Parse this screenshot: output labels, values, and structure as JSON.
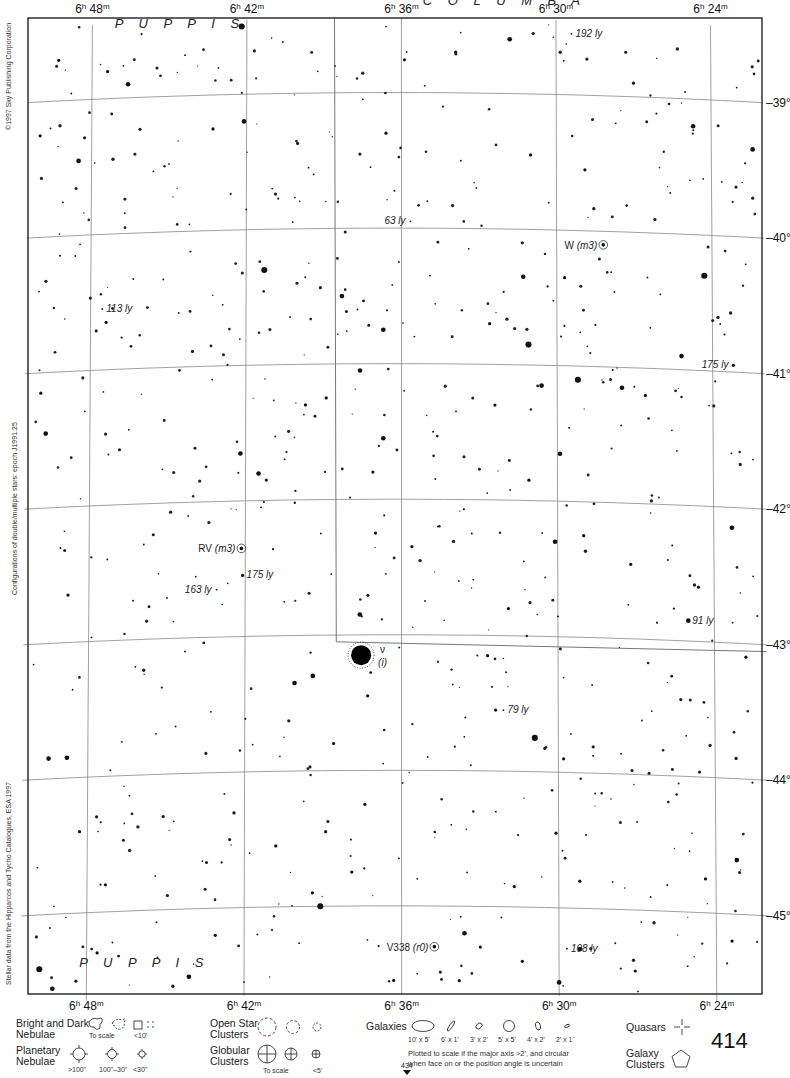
{
  "atlas": {
    "page_number": "414",
    "adjacent_page_below": "434",
    "copyright": "©1997 Sky Publishing Corporation",
    "epoch_note": "Configurations of double/multiple stars: epoch J1991.25",
    "data_source": "Stellar data from the Hipparcos and Tycho Catalogues, ESA 1997"
  },
  "chart_data": {
    "type": "scatter",
    "x_axis": {
      "label": "Right Ascension",
      "ticks": [
        "6h 48m",
        "6h 42m",
        "6h 36m",
        "6h 30m",
        "6h 24m"
      ],
      "tick_parts": [
        {
          "h": "6",
          "m": "48"
        },
        {
          "h": "6",
          "m": "42"
        },
        {
          "h": "6",
          "m": "36"
        },
        {
          "h": "6",
          "m": "30"
        },
        {
          "h": "6",
          "m": "24"
        }
      ],
      "range_minutes": [
        50.5,
        22.0
      ]
    },
    "y_axis": {
      "label": "Declination",
      "ticks": [
        "-39°",
        "-40°",
        "-41°",
        "-42°",
        "-43°",
        "-44°",
        "-45°"
      ],
      "range_deg": [
        -38.45,
        -45.65
      ]
    },
    "grid": true,
    "constellations": [
      {
        "name": "PUPPIS",
        "ra_min": 44.6,
        "dec": -38.5
      },
      {
        "name": "COLUMBA",
        "ra_min": 32.0,
        "dec": -38.35
      },
      {
        "name": "PUPPIS",
        "ra_min": 45.8,
        "dec": -45.42
      }
    ],
    "boundary": [
      [
        38.6,
        -38.45
      ],
      [
        38.5,
        -43.05
      ],
      [
        22.0,
        -43.05
      ]
    ],
    "labeled_objects": [
      {
        "label": "ν",
        "sublabel": "(i)",
        "ra_min": 37.55,
        "dec": -43.15,
        "mag": 1,
        "type": "star-variable"
      },
      {
        "label": "RV (m3)",
        "ra_min": 42.15,
        "dec": -42.35,
        "mag": 6,
        "type": "variable"
      },
      {
        "label": "W (m3)",
        "ra_min": 28.2,
        "dec": -40.1,
        "mag": 9,
        "type": "variable"
      },
      {
        "label": "V338 (r0)",
        "ra_min": 34.75,
        "dec": -45.3,
        "mag": 8,
        "type": "variable"
      },
      {
        "label": "192 ly",
        "ra_min": 29.4,
        "dec": -38.55,
        "mag": 6,
        "type": "distance"
      },
      {
        "label": "63 ly",
        "ra_min": 35.65,
        "dec": -39.95,
        "mag": 7,
        "type": "distance"
      },
      {
        "label": "113 ly",
        "ra_min": 47.55,
        "dec": -40.55,
        "mag": 7,
        "type": "distance"
      },
      {
        "label": "175 ly",
        "ra_min": 23.2,
        "dec": -40.95,
        "mag": 5,
        "type": "distance"
      },
      {
        "label": "175 ly",
        "ra_min": 42.1,
        "dec": -42.55,
        "mag": 5,
        "type": "distance"
      },
      {
        "label": "163 ly",
        "ra_min": 43.1,
        "dec": -42.65,
        "mag": 6,
        "type": "distance"
      },
      {
        "label": "91 ly",
        "ra_min": 25.0,
        "dec": -42.85,
        "mag": 4,
        "type": "distance"
      },
      {
        "label": "79 ly",
        "ra_min": 32.1,
        "dec": -43.55,
        "mag": 6,
        "type": "distance"
      },
      {
        "label": "108 ly",
        "ra_min": 29.7,
        "dec": -45.3,
        "mag": 7,
        "type": "distance"
      }
    ],
    "stars": [
      [
        42.2,
        -38.5,
        3
      ],
      [
        49.3,
        -38.7,
        5
      ],
      [
        35.2,
        -38.4,
        7
      ],
      [
        31.8,
        -38.6,
        4
      ],
      [
        33.9,
        -38.7,
        5
      ],
      [
        35.8,
        -38.7,
        6
      ],
      [
        29.7,
        -38.75,
        7
      ],
      [
        35.1,
        -38.95,
        6
      ],
      [
        27.0,
        -38.9,
        5
      ],
      [
        25.0,
        -38.95,
        6
      ],
      [
        23.0,
        -38.9,
        7
      ],
      [
        50.0,
        -39.25,
        5
      ],
      [
        43.1,
        -38.8,
        7
      ],
      [
        44.4,
        -38.7,
        6
      ],
      [
        47.4,
        -38.8,
        5
      ],
      [
        48.8,
        -38.95,
        6
      ],
      [
        49.6,
        -39.2,
        6
      ],
      [
        46.6,
        -38.9,
        4
      ],
      [
        42.1,
        -39.2,
        4
      ],
      [
        43.3,
        -39.25,
        5
      ],
      [
        36.6,
        -39.3,
        5
      ],
      [
        37.5,
        -39.05,
        6
      ],
      [
        33.7,
        -39.5,
        6
      ],
      [
        31.0,
        -39.45,
        5
      ],
      [
        27.7,
        -39.2,
        6
      ],
      [
        24.7,
        -39.2,
        4
      ],
      [
        22.4,
        -39.35,
        4
      ],
      [
        48.5,
        -39.45,
        4
      ],
      [
        45.0,
        -39.5,
        6
      ],
      [
        41.0,
        -39.7,
        7
      ],
      [
        39.6,
        -39.55,
        6
      ],
      [
        37.2,
        -39.55,
        6
      ],
      [
        35.0,
        -39.8,
        7
      ],
      [
        33.1,
        -39.7,
        6
      ],
      [
        30.3,
        -39.8,
        7
      ],
      [
        25.6,
        -39.7,
        7
      ],
      [
        23.6,
        -39.6,
        6
      ],
      [
        49.1,
        -39.75,
        7
      ],
      [
        46.7,
        -39.85,
        6
      ],
      [
        45.6,
        -39.55,
        6
      ],
      [
        44.2,
        -39.95,
        7
      ],
      [
        42.0,
        -39.85,
        6
      ],
      [
        40.2,
        -39.95,
        6
      ],
      [
        39.4,
        -39.6,
        6
      ],
      [
        28.9,
        -39.55,
        5
      ],
      [
        26.2,
        -39.9,
        5
      ],
      [
        48.6,
        -40.15,
        6
      ],
      [
        45.2,
        -40.35,
        7
      ],
      [
        41.3,
        -40.3,
        3
      ],
      [
        38.3,
        -40.5,
        4
      ],
      [
        36.1,
        -40.25,
        6
      ],
      [
        34.9,
        -40.35,
        6
      ],
      [
        33.4,
        -40.15,
        6
      ],
      [
        31.3,
        -40.35,
        4
      ],
      [
        29.7,
        -40.35,
        5
      ],
      [
        27.9,
        -40.3,
        7
      ],
      [
        26.0,
        -40.45,
        6
      ],
      [
        24.3,
        -40.3,
        3
      ],
      [
        22.7,
        -40.2,
        7
      ],
      [
        50.0,
        -40.4,
        6
      ],
      [
        47.4,
        -40.65,
        5
      ],
      [
        44.6,
        -40.6,
        6
      ],
      [
        42.9,
        -40.55,
        7
      ],
      [
        40.3,
        -40.65,
        6
      ],
      [
        37.7,
        -40.6,
        6
      ],
      [
        36.7,
        -40.75,
        4
      ],
      [
        35.5,
        -40.8,
        6
      ],
      [
        32.6,
        -40.7,
        5
      ],
      [
        31.1,
        -40.85,
        3
      ],
      [
        29.1,
        -40.75,
        6
      ],
      [
        26.4,
        -40.7,
        6
      ],
      [
        25.2,
        -40.9,
        4
      ],
      [
        23.7,
        -40.65,
        7
      ],
      [
        49.9,
        -41.15,
        5
      ],
      [
        48.2,
        -41.3,
        6
      ],
      [
        46.5,
        -41.45,
        6
      ],
      [
        43.3,
        -41.1,
        6
      ],
      [
        42.2,
        -41.65,
        4
      ],
      [
        39.7,
        -41.3,
        5
      ],
      [
        38.9,
        -41.25,
        5
      ],
      [
        37.6,
        -41.05,
        4
      ],
      [
        36.7,
        -41.55,
        4
      ],
      [
        35.9,
        -41.2,
        6
      ],
      [
        33.9,
        -41.35,
        6
      ],
      [
        32.4,
        -41.3,
        5
      ],
      [
        30.6,
        -41.15,
        4
      ],
      [
        29.2,
        -41.1,
        3
      ],
      [
        27.5,
        -41.15,
        4
      ],
      [
        26.6,
        -41.2,
        5
      ],
      [
        25.4,
        -41.6,
        6
      ],
      [
        23.3,
        -41.6,
        6
      ],
      [
        49.7,
        -41.45,
        4
      ],
      [
        45.2,
        -41.75,
        6
      ],
      [
        41.5,
        -41.8,
        4
      ],
      [
        41.2,
        -41.85,
        5
      ],
      [
        40.5,
        -41.7,
        7
      ],
      [
        37.1,
        -41.8,
        5
      ],
      [
        34.7,
        -41.85,
        6
      ],
      [
        32.7,
        -41.95,
        6
      ],
      [
        31.1,
        -41.85,
        5
      ],
      [
        29.9,
        -41.65,
        4
      ],
      [
        26.1,
        -41.95,
        6
      ],
      [
        50.3,
        -42.1,
        6
      ],
      [
        49.1,
        -42.3,
        6
      ],
      [
        47.3,
        -42.4,
        6
      ],
      [
        45.9,
        -42.3,
        6
      ],
      [
        44.2,
        -42.1,
        7
      ],
      [
        41.4,
        -42.05,
        6
      ],
      [
        39.1,
        -42.25,
        6
      ],
      [
        37.0,
        -42.25,
        5
      ],
      [
        35.6,
        -42.35,
        5
      ],
      [
        34.6,
        -42.2,
        6
      ],
      [
        33.3,
        -42.25,
        6
      ],
      [
        31.3,
        -42.45,
        6
      ],
      [
        30.1,
        -42.3,
        4
      ],
      [
        29.0,
        -42.25,
        5
      ],
      [
        27.2,
        -42.45,
        5
      ],
      [
        25.6,
        -42.3,
        6
      ],
      [
        23.3,
        -42.15,
        4
      ],
      [
        22.5,
        -42.5,
        6
      ],
      [
        48.8,
        -42.65,
        5
      ],
      [
        45.0,
        -42.7,
        6
      ],
      [
        43.9,
        -42.55,
        6
      ],
      [
        40.5,
        -42.75,
        6
      ],
      [
        38.7,
        -42.55,
        6
      ],
      [
        37.6,
        -42.85,
        4
      ],
      [
        36.6,
        -42.55,
        6
      ],
      [
        35.1,
        -42.75,
        6
      ],
      [
        33.8,
        -42.6,
        6
      ],
      [
        31.9,
        -42.8,
        5
      ],
      [
        30.0,
        -42.85,
        6
      ],
      [
        27.3,
        -42.75,
        6
      ],
      [
        24.6,
        -42.6,
        5
      ],
      [
        23.3,
        -42.85,
        6
      ],
      [
        50.1,
        -43.15,
        6
      ],
      [
        48.6,
        -43.35,
        6
      ],
      [
        46.2,
        -43.2,
        6
      ],
      [
        44.3,
        -43.1,
        7
      ],
      [
        40.1,
        -43.35,
        4
      ],
      [
        39.4,
        -43.3,
        4
      ],
      [
        37.3,
        -43.45,
        5
      ],
      [
        34.6,
        -43.2,
        6
      ],
      [
        32.7,
        -43.15,
        5
      ],
      [
        32.4,
        -43.55,
        5
      ],
      [
        30.9,
        -43.75,
        3
      ],
      [
        28.7,
        -43.35,
        6
      ],
      [
        26.8,
        -43.6,
        6
      ],
      [
        24.4,
        -43.45,
        6
      ],
      [
        22.8,
        -43.1,
        5
      ],
      [
        49.5,
        -43.85,
        4
      ],
      [
        48.8,
        -43.85,
        4
      ],
      [
        46.7,
        -43.75,
        6
      ],
      [
        45.4,
        -43.7,
        6
      ],
      [
        43.3,
        -43.55,
        6
      ],
      [
        41.7,
        -43.8,
        6
      ],
      [
        38.6,
        -43.8,
        5
      ],
      [
        36.7,
        -43.95,
        6
      ],
      [
        35.0,
        -43.9,
        6
      ],
      [
        33.6,
        -43.75,
        6
      ],
      [
        29.8,
        -43.9,
        5
      ],
      [
        27.6,
        -43.85,
        6
      ],
      [
        25.1,
        -43.7,
        7
      ],
      [
        23.2,
        -43.85,
        5
      ],
      [
        50.2,
        -44.2,
        6
      ],
      [
        48.3,
        -44.4,
        5
      ],
      [
        46.4,
        -44.15,
        6
      ],
      [
        44.7,
        -44.35,
        6
      ],
      [
        42.4,
        -44.3,
        5
      ],
      [
        40.8,
        -44.55,
        5
      ],
      [
        38.9,
        -44.45,
        5
      ],
      [
        37.4,
        -44.25,
        5
      ],
      [
        36.1,
        -44.65,
        6
      ],
      [
        34.1,
        -44.4,
        6
      ],
      [
        32.4,
        -44.3,
        6
      ],
      [
        30.1,
        -44.45,
        5
      ],
      [
        28.6,
        -44.15,
        6
      ],
      [
        27.0,
        -44.35,
        6
      ],
      [
        25.0,
        -44.55,
        6
      ],
      [
        23.2,
        -44.6,
        4
      ],
      [
        49.9,
        -44.65,
        6
      ],
      [
        47.3,
        -44.8,
        5
      ],
      [
        45.4,
        -44.75,
        6
      ],
      [
        43.6,
        -44.65,
        6
      ],
      [
        41.8,
        -44.6,
        6
      ],
      [
        39.4,
        -44.9,
        5
      ],
      [
        37.9,
        -44.75,
        5
      ],
      [
        35.4,
        -44.8,
        6
      ],
      [
        33.5,
        -44.75,
        6
      ],
      [
        31.7,
        -44.85,
        5
      ],
      [
        29.2,
        -44.8,
        5
      ],
      [
        26.5,
        -44.9,
        6
      ],
      [
        24.4,
        -44.75,
        5
      ],
      [
        22.3,
        -44.7,
        4
      ],
      [
        49.4,
        -45.1,
        6
      ],
      [
        47.6,
        -45.3,
        5
      ],
      [
        45.3,
        -45.35,
        6
      ],
      [
        43.1,
        -45.2,
        5
      ],
      [
        41.5,
        -45.2,
        6
      ],
      [
        39.1,
        -45.0,
        3
      ],
      [
        37.3,
        -45.25,
        6
      ],
      [
        35.4,
        -45.5,
        6
      ],
      [
        33.6,
        -45.2,
        4
      ],
      [
        33.0,
        -45.3,
        5
      ],
      [
        31.4,
        -45.4,
        5
      ],
      [
        29.2,
        -45.3,
        4
      ],
      [
        27.1,
        -45.45,
        5
      ],
      [
        25.1,
        -45.4,
        6
      ],
      [
        23.4,
        -45.2,
        5
      ],
      [
        49.8,
        -45.4,
        3
      ],
      [
        49.3,
        -45.55,
        4
      ],
      [
        44.1,
        -45.5,
        4
      ],
      [
        42.0,
        -45.55,
        6
      ],
      [
        36.3,
        -45.55,
        5
      ],
      [
        33.8,
        -45.55,
        5
      ],
      [
        30.0,
        -45.55,
        4
      ],
      [
        27.0,
        -45.6,
        6
      ],
      [
        24.4,
        -45.6,
        4
      ]
    ]
  },
  "legend": {
    "nebulae": {
      "title_line1": "Bright and Dark",
      "title_line2": "Nebulae",
      "to_scale": "To scale",
      "small": "<10'"
    },
    "planetary": {
      "title_line1": "Planetary",
      "title_line2": "Nebulae",
      "sizes": [
        ">100\"",
        "100\"–30\"",
        "<30\""
      ]
    },
    "open_clusters": {
      "title_line1": "Open Star",
      "title_line2": "Clusters"
    },
    "globular_clusters": {
      "title_line1": "Globular",
      "title_line2": "Clusters",
      "to_scale": "To scale",
      "small": "<5'"
    },
    "galaxies": {
      "title": "Galaxies",
      "sizes": [
        "10' x 5'",
        "6' x 1'",
        "3' x 2'",
        "5' x 5'",
        "4' x 2'",
        "2' x 1'"
      ],
      "note_line1": "Plotted to scale if the major axis >2', and circular",
      "note_line2": "when face on or the position angle is uncertain"
    },
    "quasars": {
      "title": "Quasars"
    },
    "galaxy_clusters": {
      "title_line1": "Galaxy",
      "title_line2": "Clusters"
    }
  }
}
